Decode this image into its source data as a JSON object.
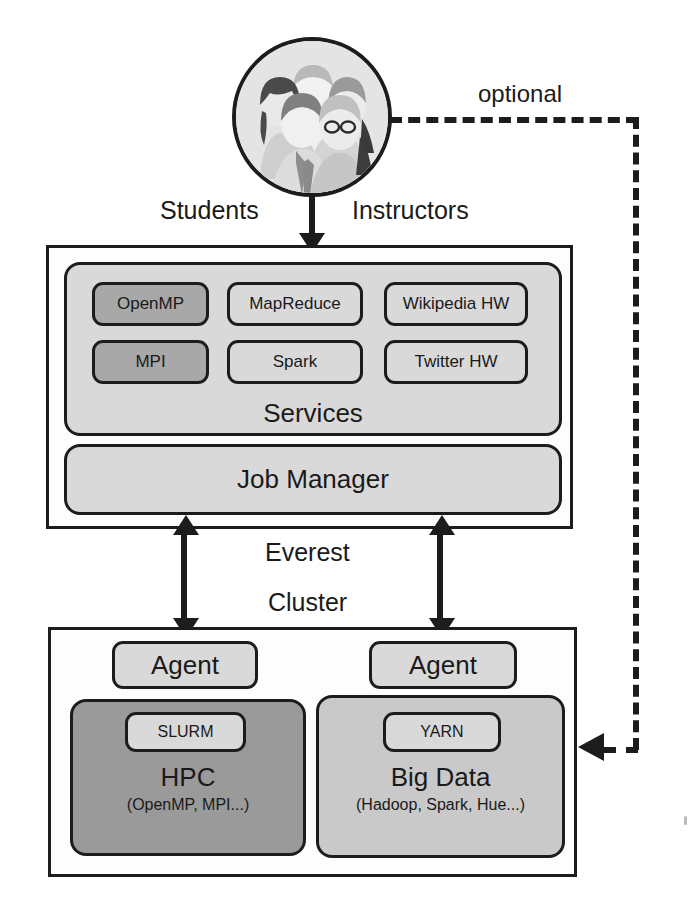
{
  "diagram": {
    "users": {
      "icon": "people-group-icon",
      "left_label": "Students",
      "right_label": "Instructors"
    },
    "optional_link": {
      "label": "optional"
    },
    "everest": {
      "services": {
        "title": "Services",
        "items": [
          {
            "label": "OpenMP",
            "shade": "dark"
          },
          {
            "label": "MapReduce",
            "shade": "light"
          },
          {
            "label": "Wikipedia HW",
            "shade": "light"
          },
          {
            "label": "MPI",
            "shade": "dark"
          },
          {
            "label": "Spark",
            "shade": "light"
          },
          {
            "label": "Twitter HW",
            "shade": "light"
          }
        ]
      },
      "job_manager": {
        "label": "Job Manager"
      }
    },
    "middle_labels": {
      "line1": "Everest",
      "line2": "Cluster"
    },
    "cluster": {
      "left": {
        "agent_label": "Agent",
        "scheduler_label": "SLURM",
        "title": "HPC",
        "subtitle": "(OpenMP, MPI...)",
        "shade": "dark"
      },
      "right": {
        "agent_label": "Agent",
        "scheduler_label": "YARN",
        "title": "Big Data",
        "subtitle": "(Hadoop, Spark, Hue...)",
        "shade": "mid"
      }
    },
    "colors": {
      "stroke": "#1c1c1c",
      "panel_bg": "#fdfdfd",
      "shade_light": "#d9d9d9",
      "shade_mid": "#c9c9c9",
      "shade_dark": "#a8a8a8",
      "shade_vdark": "#9a9a9a"
    }
  }
}
